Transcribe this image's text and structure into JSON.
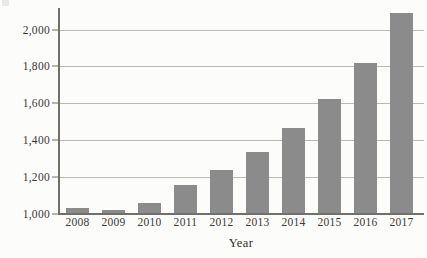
{
  "chart_data": {
    "type": "bar",
    "title": "",
    "xlabel": "Year",
    "ylabel": "",
    "categories": [
      "2008",
      "2009",
      "2010",
      "2011",
      "2012",
      "2013",
      "2014",
      "2015",
      "2016",
      "2017"
    ],
    "values": [
      1030,
      1015,
      1055,
      1150,
      1235,
      1330,
      1465,
      1620,
      1820,
      2090
    ],
    "ylim": [
      1000,
      2100
    ],
    "ytick_values": [
      1000,
      1200,
      1400,
      1600,
      1800,
      2000
    ],
    "ytick_labels": [
      "1,000",
      "1,200",
      "1,400",
      "1,600",
      "1,800",
      "2,000"
    ],
    "grid": true,
    "legend": false,
    "bar_color": "#8b8b8b",
    "gridline_color": "#b9b9b4",
    "axis_color": "#6f6f6b",
    "background_color": "#fcfcfb"
  },
  "axes": {
    "x_title": "Year"
  }
}
